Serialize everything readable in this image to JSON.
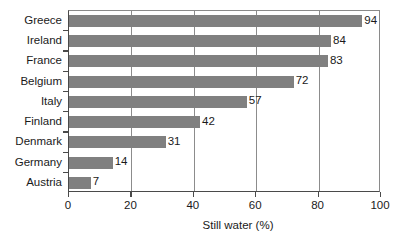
{
  "chart_data": {
    "type": "bar",
    "orientation": "horizontal",
    "title": "",
    "xlabel": "Still water (%)",
    "ylabel": "",
    "categories": [
      "Greece",
      "Ireland",
      "France",
      "Belgium",
      "Italy",
      "Finland",
      "Denmark",
      "Germany",
      "Austria"
    ],
    "values": [
      94,
      84,
      83,
      72,
      57,
      42,
      31,
      14,
      7
    ],
    "value_labels": [
      "94",
      "84",
      "83",
      "72",
      "57",
      "42",
      "31",
      "14",
      "7"
    ],
    "xlim": [
      0,
      100
    ],
    "xticks": [
      0,
      20,
      40,
      60,
      80,
      100
    ],
    "xtick_labels": [
      "0",
      "20",
      "40",
      "60",
      "80",
      "100"
    ],
    "grid": "vertical",
    "gridlines_at": [
      20,
      40,
      60,
      80
    ],
    "legend": null,
    "bar_color": "#808080",
    "axis_color": "#4a4a4a",
    "text_color": "#1a1a1a",
    "background": "#ffffff"
  }
}
